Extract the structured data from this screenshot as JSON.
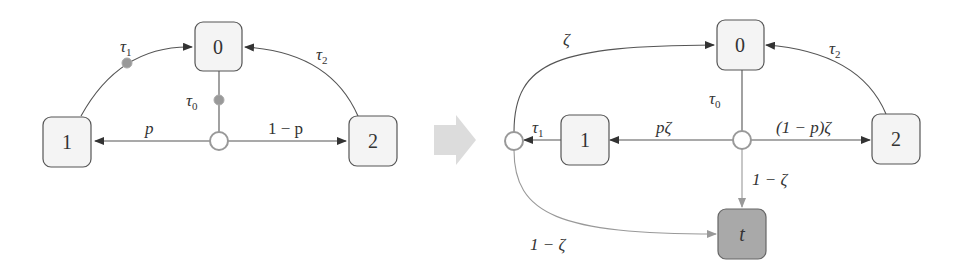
{
  "left_diagram": {
    "nodes": {
      "n0": {
        "label": "0"
      },
      "n1": {
        "label": "1"
      },
      "n2": {
        "label": "2"
      }
    },
    "edges": {
      "tau1": {
        "label": "τ",
        "sub": "1"
      },
      "tau2": {
        "label": "τ",
        "sub": "2"
      },
      "tau0": {
        "label": "τ",
        "sub": "0"
      },
      "p": {
        "label": "p"
      },
      "one_minus_p": {
        "label": "1 − p"
      }
    }
  },
  "transform_arrow": {
    "icon": "right-arrow-icon",
    "color": "#dcdcdc"
  },
  "right_diagram": {
    "nodes": {
      "n0": {
        "label": "0"
      },
      "n1": {
        "label": "1"
      },
      "n2": {
        "label": "2"
      },
      "t": {
        "label": "t"
      }
    },
    "edges": {
      "zeta": {
        "label": "ζ"
      },
      "tau2": {
        "label": "τ",
        "sub": "2"
      },
      "tau0": {
        "label": "τ",
        "sub": "0"
      },
      "tau1": {
        "label": "τ",
        "sub": "1"
      },
      "p_zeta": {
        "label": "pζ"
      },
      "one_minus_p_zeta": {
        "label": "(1 − p)ζ"
      },
      "one_minus_zeta_down": {
        "label": "1 − ζ"
      },
      "one_minus_zeta_curve": {
        "label": "1 − ζ"
      }
    }
  },
  "colors": {
    "node_fill": "#f4f4f4",
    "sink_fill": "#a9a9a9",
    "edge": "#555555",
    "light_edge": "#999999"
  }
}
